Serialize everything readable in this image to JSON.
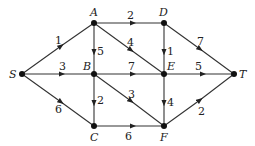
{
  "diagram": {
    "type": "flow-network",
    "nodes": [
      {
        "id": "S",
        "label": "S",
        "x": 22,
        "y": 74
      },
      {
        "id": "A",
        "label": "A",
        "x": 94,
        "y": 23
      },
      {
        "id": "D",
        "label": "D",
        "x": 164,
        "y": 23
      },
      {
        "id": "B",
        "label": "B",
        "x": 94,
        "y": 74
      },
      {
        "id": "E",
        "label": "E",
        "x": 164,
        "y": 74
      },
      {
        "id": "T",
        "label": "T",
        "x": 234,
        "y": 74
      },
      {
        "id": "C",
        "label": "C",
        "x": 94,
        "y": 126
      },
      {
        "id": "F",
        "label": "F",
        "x": 164,
        "y": 126
      }
    ],
    "edges": [
      {
        "from": "S",
        "to": "A",
        "weight": "1"
      },
      {
        "from": "S",
        "to": "B",
        "weight": "3"
      },
      {
        "from": "S",
        "to": "C",
        "weight": "6"
      },
      {
        "from": "A",
        "to": "D",
        "weight": "2"
      },
      {
        "from": "A",
        "to": "B",
        "weight": "5"
      },
      {
        "from": "A",
        "to": "E",
        "weight": "4"
      },
      {
        "from": "D",
        "to": "E",
        "weight": "1"
      },
      {
        "from": "D",
        "to": "T",
        "weight": "7"
      },
      {
        "from": "B",
        "to": "E",
        "weight": "7"
      },
      {
        "from": "B",
        "to": "C",
        "weight": "2"
      },
      {
        "from": "B",
        "to": "F",
        "weight": "3"
      },
      {
        "from": "E",
        "to": "T",
        "weight": "5"
      },
      {
        "from": "E",
        "to": "F",
        "weight": "4"
      },
      {
        "from": "C",
        "to": "F",
        "weight": "6"
      },
      {
        "from": "F",
        "to": "T",
        "weight": "2"
      }
    ]
  },
  "labels": {
    "S": "S",
    "A": "A",
    "D": "D",
    "B": "B",
    "E": "E",
    "T": "T",
    "C": "C",
    "F": "F",
    "w_SA": "1",
    "w_SB": "3",
    "w_SC": "6",
    "w_AD": "2",
    "w_AB": "5",
    "w_AE": "4",
    "w_DE": "1",
    "w_DT": "7",
    "w_BE": "7",
    "w_BC": "2",
    "w_BF": "3",
    "w_ET": "5",
    "w_EF": "4",
    "w_CF": "6",
    "w_FT": "2"
  }
}
